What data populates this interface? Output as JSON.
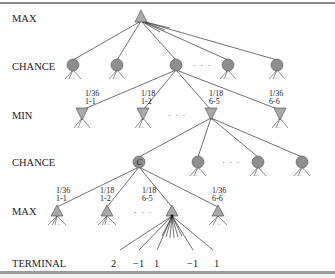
{
  "diagram": {
    "type": "expectiminimax-game-tree",
    "row_labels": [
      "MAX",
      "CHANCE",
      "MIN",
      "CHANCE",
      "MAX",
      "TERMINAL"
    ],
    "chance_node_label": "C",
    "ellipsis": "· · ·",
    "subtree_ellipsis": "...",
    "level_minus_branches": [
      {
        "prob": "1/36",
        "roll": "1-1"
      },
      {
        "prob": "1/18",
        "roll": "1-2"
      },
      {
        "prob": "1/18",
        "roll": "6-5"
      },
      {
        "prob": "1/36",
        "roll": "6-6"
      }
    ],
    "level_max_branches": [
      {
        "prob": "1/36",
        "roll": "1-1"
      },
      {
        "prob": "1/18",
        "roll": "1-2"
      },
      {
        "prob": "1/18",
        "roll": "6-5"
      },
      {
        "prob": "1/36",
        "roll": "6-6"
      }
    ],
    "terminal_values": [
      "2",
      "−1",
      "1",
      "−1",
      "1"
    ],
    "colors": {
      "node_fill_chance": "#8e8e8e",
      "node_fill_minmax": "#a9a9a9",
      "edge": "#333333",
      "border": "#8a8a8a"
    }
  }
}
